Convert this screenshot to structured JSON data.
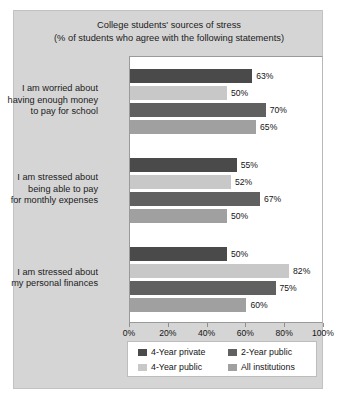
{
  "chart_data": {
    "type": "bar",
    "orientation": "horizontal",
    "title": "College students' sources of stress (% of students who agree with the following statements)",
    "title_lines": [
      "College students' sources of stress",
      "(% of students who agree with the following statements)"
    ],
    "xlabel": "",
    "ylabel": "",
    "xlim": [
      0,
      100
    ],
    "xticks": [
      0,
      20,
      40,
      60,
      80,
      100
    ],
    "xtick_labels": [
      "0%",
      "20%",
      "40%",
      "60%",
      "80%",
      "100%"
    ],
    "grid": false,
    "legend_position": "bottom",
    "categories": [
      "I am worried about having enough money to pay for school",
      "I am stressed about being able to pay for monthly expenses",
      "I am stressed about my personal finances"
    ],
    "category_lines": [
      [
        "I am worried about",
        "having enough money",
        "to pay for school"
      ],
      [
        "I am stressed about",
        "being able to pay",
        "for monthly expenses"
      ],
      [
        "I am stressed about",
        "my personal finances"
      ]
    ],
    "series": [
      {
        "name": "4-Year private",
        "color": "#4a4a4a",
        "values": [
          63,
          55,
          50
        ],
        "labels": [
          "63%",
          "55%",
          "50%"
        ]
      },
      {
        "name": "4-Year public",
        "color": "#c8c8c8",
        "values": [
          50,
          52,
          82
        ],
        "labels": [
          "50%",
          "52%",
          "82%"
        ]
      },
      {
        "name": "2-Year public",
        "color": "#606060",
        "values": [
          70,
          67,
          75
        ],
        "labels": [
          "70%",
          "67%",
          "75%"
        ]
      },
      {
        "name": "All institutions",
        "color": "#a0a0a0",
        "values": [
          65,
          50,
          60
        ],
        "labels": [
          "65%",
          "50%",
          "60%"
        ]
      }
    ]
  },
  "legend": {
    "items": [
      {
        "label": "4-Year private",
        "color": "#4a4a4a"
      },
      {
        "label": "4-Year public",
        "color": "#c8c8c8"
      },
      {
        "label": "2-Year public",
        "color": "#606060"
      },
      {
        "label": "All institutions",
        "color": "#a0a0a0"
      }
    ]
  },
  "colors": {
    "figure_background": "#d5d5d5",
    "plot_background": "#ffffff",
    "text": "#141414",
    "axis": "#8f8f8f"
  }
}
